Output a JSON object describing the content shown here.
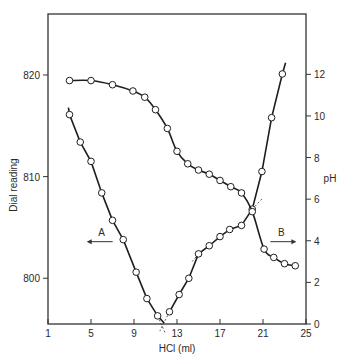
{
  "chart_data": {
    "type": "line",
    "title": "",
    "xlabel": "HCl (ml)",
    "ylabel_left": "Dial reading",
    "ylabel_right": "pH",
    "xlim": [
      1,
      25
    ],
    "ylim_left": [
      795.5,
      826
    ],
    "ylim_right": [
      0,
      14.9
    ],
    "x_ticks": [
      1,
      5,
      9,
      13,
      17,
      21,
      25
    ],
    "y_left_ticks": [
      800,
      810,
      820
    ],
    "y_right_ticks": [
      0,
      2,
      4,
      6,
      8,
      10,
      12
    ],
    "grid": false,
    "annotations": [
      {
        "label": "A",
        "direction": "left",
        "x": 5.9,
        "y_left": 803.6
      },
      {
        "label": "B",
        "direction": "right",
        "x": 22.8,
        "y_left": 803.6
      }
    ],
    "series": [
      {
        "name": "Dial reading (descending)",
        "axis": "left",
        "x": [
          3,
          4,
          5,
          6,
          7,
          8,
          9.2,
          10.2,
          11.2
        ],
        "values": [
          816.1,
          813.4,
          811.5,
          808.4,
          805.7,
          803.8,
          800.6,
          798.0,
          796.3
        ]
      },
      {
        "name": "Dial reading (ascending)",
        "axis": "left",
        "x": [
          12.3,
          13.2,
          14.1,
          15,
          16,
          17,
          17.9,
          19,
          20,
          20.9,
          21.8,
          22.8
        ],
        "values": [
          796.7,
          798.4,
          800.0,
          802.4,
          803.2,
          804.1,
          804.8,
          805.2,
          806.8,
          810.5,
          815.8,
          820.1
        ]
      },
      {
        "name": "pH",
        "axis": "right",
        "x": [
          3,
          5,
          7,
          8.9,
          10,
          11,
          12.1,
          13,
          14,
          15,
          16,
          17,
          18,
          19,
          20,
          21.1,
          22,
          23,
          24
        ],
        "values": [
          11.7,
          11.7,
          11.5,
          11.2,
          10.9,
          10.3,
          9.4,
          8.3,
          7.7,
          7.4,
          7.2,
          6.9,
          6.6,
          6.3,
          5.4,
          3.6,
          3.2,
          2.9,
          2.8
        ]
      }
    ]
  }
}
